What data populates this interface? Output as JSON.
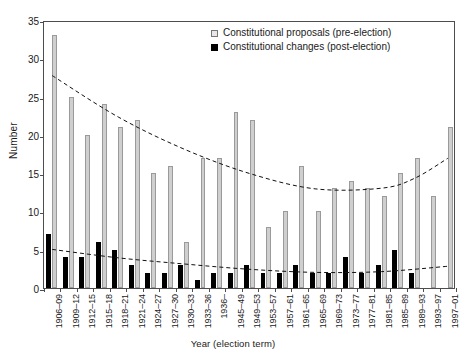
{
  "chart_data": {
    "type": "bar",
    "title": "",
    "xlabel": "Year (election term)",
    "ylabel": "Number",
    "ylim": [
      0,
      35
    ],
    "ytick_step": 5,
    "yticks": [
      0,
      5,
      10,
      15,
      20,
      25,
      30,
      35
    ],
    "grid": false,
    "legend_position": "top-right",
    "categories": [
      "1906–09",
      "1909–12",
      "1912–15",
      "1915–18",
      "1918–21",
      "1921–24",
      "1924–27",
      "1927–30",
      "1930–33",
      "1933–36",
      "1936–",
      "1945–49",
      "1949–53",
      "1953–57",
      "1957–61",
      "1961–65",
      "1965–69",
      "1969–73",
      "1973–77",
      "1977–81",
      "1981–85",
      "1985–89",
      "1989–93",
      "1993–97",
      "1997–01"
    ],
    "series": [
      {
        "name": "Constitutional proposals (pre-election)",
        "color": "#cfcfcf",
        "values": [
          33,
          25,
          20,
          24,
          21,
          22,
          15,
          16,
          6,
          17,
          17,
          23,
          22,
          8,
          10,
          16,
          10,
          13,
          14,
          13,
          12,
          15,
          17,
          12,
          21
        ]
      },
      {
        "name": "Constitutional changes (post-election)",
        "color": "#000000",
        "values": [
          7,
          4,
          4,
          6,
          5,
          3,
          2,
          2,
          3,
          1,
          2,
          2,
          3,
          2,
          2,
          3,
          2,
          2,
          4,
          2,
          3,
          5,
          2,
          0,
          0
        ]
      }
    ],
    "trendlines": [
      {
        "name": "proposals-trend",
        "style": "dashed",
        "points": [
          [
            0,
            28.0
          ],
          [
            4,
            22.6
          ],
          [
            8,
            18.4
          ],
          [
            12,
            15.2
          ],
          [
            16,
            13.2
          ],
          [
            20,
            13.3
          ],
          [
            22,
            14.6
          ],
          [
            24,
            17.2
          ]
        ]
      },
      {
        "name": "changes-trend",
        "style": "dashed",
        "points": [
          [
            0,
            5.3
          ],
          [
            4,
            4.2
          ],
          [
            8,
            3.4
          ],
          [
            12,
            2.7
          ],
          [
            16,
            2.3
          ],
          [
            20,
            2.4
          ],
          [
            24,
            3.1
          ]
        ]
      }
    ]
  },
  "legend": {
    "items": [
      {
        "label": "Constitutional proposals (pre-election)",
        "swatch": "open-square-icon"
      },
      {
        "label": "Constitutional changes (post-election)",
        "swatch": "filled-square-icon"
      }
    ]
  },
  "axes": {
    "y_title": "Number",
    "x_title": "Year (election term)"
  }
}
